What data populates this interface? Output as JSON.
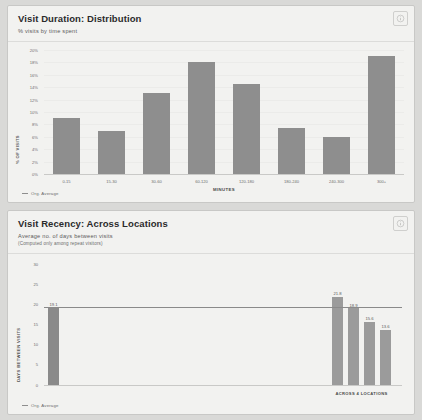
{
  "cards": [
    {
      "id": "visit-duration",
      "title": "Visit Duration: Distribution",
      "subtitle": "% visits by time spent",
      "subtitle2": "",
      "info_icon": "info-circle-icon",
      "legend": {
        "label": "Org. Average",
        "color": "#8e8e8e"
      }
    },
    {
      "id": "visit-recency",
      "title": "Visit Recency: Across Locations",
      "subtitle": "Average no. of days between visits",
      "subtitle2": "(Computed only among repeat visitors)",
      "info_icon": "info-circle-icon",
      "legend": {
        "label": "Org. Average",
        "color": "#8e8e8e"
      }
    }
  ],
  "chart_data": [
    {
      "type": "bar",
      "title": "Visit Duration: Distribution",
      "subtitle": "% visits by time spent",
      "xlabel": "MINUTES",
      "ylabel": "% OF VISITS",
      "categories": [
        "0-15",
        "15-30",
        "30-60",
        "60-120",
        "120-180",
        "180-240",
        "240-300",
        "300+"
      ],
      "values": [
        9,
        7,
        13,
        18,
        14.5,
        7.5,
        6,
        19
      ],
      "ylim": [
        0,
        20
      ],
      "yticks": [
        0,
        2,
        4,
        6,
        8,
        10,
        12,
        14,
        16,
        18,
        20
      ],
      "ytick_labels": [
        "0%",
        "2%",
        "4%",
        "6%",
        "8%",
        "10%",
        "12%",
        "14%",
        "16%",
        "18%",
        "20%"
      ],
      "grid": true,
      "legend_position": "bottom-left",
      "bar_color": "#8e8e8e"
    },
    {
      "type": "bar",
      "title": "Visit Recency: Across Locations",
      "subtitle": "Average no. of days between visits",
      "annotation": "(Computed only among repeat visitors)",
      "xlabel": "",
      "ylabel": "DAYS BETWEEN VISITS",
      "categories": [
        "Org. Average",
        "Location 1",
        "Location 2",
        "Location 3",
        "Location 4"
      ],
      "values": [
        19.1,
        21.8,
        18.9,
        15.6,
        13.6
      ],
      "value_labels": [
        "19.1",
        "21.8",
        "18.9",
        "15.6",
        "13.6"
      ],
      "group_label": "ACROSS 4 LOCATIONS",
      "ylim": [
        0,
        30
      ],
      "yticks": [
        0,
        5,
        10,
        15,
        20,
        25,
        30
      ],
      "ytick_labels": [
        "0",
        "5",
        "10",
        "15",
        "20",
        "25",
        "30"
      ],
      "average_line": 19.1,
      "grid": false,
      "legend_position": "bottom-left",
      "bar_color": "#9b9b9b"
    }
  ]
}
